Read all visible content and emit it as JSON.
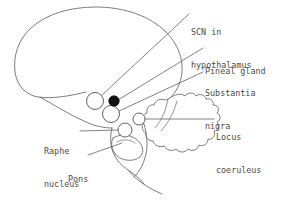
{
  "diagram": {
    "stroke_color": "#6e6e6e",
    "label_color": "#4a4a4a",
    "filled_marker_color": "#111111",
    "background_color": "#ffffff"
  },
  "labels": [
    {
      "id": "scn",
      "name": "scn-in-hypothalamus",
      "line1": "SCN in",
      "line2": "hypothalamus",
      "x": 191,
      "y": 5
    },
    {
      "id": "pineal",
      "name": "pineal-gland",
      "line1": "Pineal gland",
      "line2": "",
      "x": 205,
      "y": 44
    },
    {
      "id": "substantia-nigra",
      "name": "substantia-nigra",
      "line1": "Substantia",
      "line2": "nigra",
      "x": 205,
      "y": 66
    },
    {
      "id": "locus-coeruleus",
      "name": "locus-coeruleus",
      "line1": "Locus",
      "line2": "coeruleus",
      "x": 216,
      "y": 110
    },
    {
      "id": "raphe-nucleus",
      "name": "raphe-nucleus",
      "line1": "Raphe",
      "line2": "nucleus",
      "x": 44,
      "y": 124
    },
    {
      "id": "pons",
      "name": "pons",
      "line1": "Pons",
      "line2": "",
      "x": 68,
      "y": 152
    }
  ],
  "structures": [
    {
      "id": "cerebrum",
      "name": "cerebrum-outline"
    },
    {
      "id": "cerebellum",
      "name": "cerebellum-outline"
    },
    {
      "id": "brainstem",
      "name": "brainstem-outline"
    },
    {
      "id": "pons-bulge",
      "name": "pons-outline"
    },
    {
      "id": "spinal-cord",
      "name": "spinal-cord-outline"
    }
  ],
  "markers": [
    {
      "id": "scn-marker",
      "name": "scn-marker-circle",
      "cx": 95,
      "cy": 101,
      "r": 8.5,
      "filled": false
    },
    {
      "id": "pineal-marker",
      "name": "pineal-gland-marker-dot",
      "cx": 114,
      "cy": 101,
      "r": 5.2,
      "filled": true
    },
    {
      "id": "substantia-nigra-marker",
      "name": "substantia-nigra-marker-circle",
      "cx": 111,
      "cy": 114,
      "r": 8.5,
      "filled": false
    },
    {
      "id": "locus-coeruleus-marker",
      "name": "locus-coeruleus-marker-circle",
      "cx": 139,
      "cy": 119,
      "r": 6.0,
      "filled": false
    },
    {
      "id": "raphe-marker",
      "name": "raphe-nucleus-marker-circle",
      "cx": 125,
      "cy": 130,
      "r": 7.0,
      "filled": false
    }
  ],
  "leaders": [
    {
      "id": "leader-scn",
      "name": "leader-line-scn",
      "d": "M 189 14 L 101 96"
    },
    {
      "id": "leader-pineal",
      "name": "leader-line-pineal-gland",
      "d": "M 203 48 L 118 100"
    },
    {
      "id": "leader-substantia-nigra",
      "name": "leader-line-substantia-nigra",
      "d": "M 203 72 L 117 112"
    },
    {
      "id": "leader-locus-coeruleus",
      "name": "leader-line-locus-coeruleus",
      "d": "M 214 119 L 145 119"
    },
    {
      "id": "leader-raphe",
      "name": "leader-line-raphe-nucleus",
      "d": "M 80 131 L 118 130"
    },
    {
      "id": "leader-pons",
      "name": "leader-line-pons",
      "d": "M 88 155 L 122 143"
    }
  ]
}
